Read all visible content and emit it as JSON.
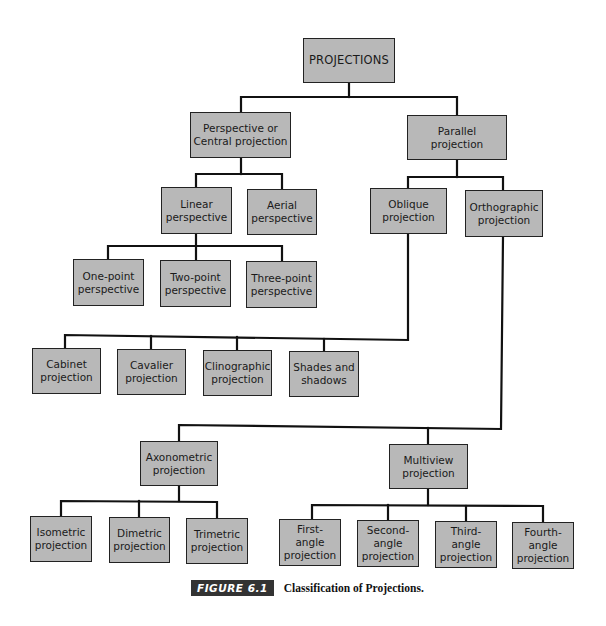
{
  "diagram": {
    "title": "Classification of Projections",
    "colors": {
      "box_fill": "#b8b8b8",
      "box_border": "#222222",
      "line": "#111111",
      "badge_bg": "#333333"
    },
    "nodes": {
      "root": "PROJECTIONS",
      "perspective": "Perspective or\nCentral projection",
      "parallel": "Parallel\nprojection",
      "linear": "Linear\nperspective",
      "aerial": "Aerial\nperspective",
      "one_point": "One-point\nperspective",
      "two_point": "Two-point\nperspective",
      "three_point": "Three-point\nperspective",
      "oblique": "Oblique\nprojection",
      "orthographic": "Orthographic\nprojection",
      "cabinet": "Cabinet\nprojection",
      "cavalier": "Cavalier\nprojection",
      "clinographic": "Clinographic\nprojection",
      "shades": "Shades and\nshadows",
      "axonometric": "Axonometric\nprojection",
      "multiview": "Multiview\nprojection",
      "isometric": "Isometric\nprojection",
      "dimetric": "Dimetric\nprojection",
      "trimetric": "Trimetric\nprojection",
      "first_angle": "First-\nangle\nprojection",
      "second_angle": "Second-\nangle\nprojection",
      "third_angle": "Third-\nangle\nprojection",
      "fourth_angle": "Fourth-\nangle\nprojection"
    },
    "edges": [
      [
        "root",
        "perspective"
      ],
      [
        "root",
        "parallel"
      ],
      [
        "perspective",
        "linear"
      ],
      [
        "perspective",
        "aerial"
      ],
      [
        "linear",
        "one_point"
      ],
      [
        "linear",
        "two_point"
      ],
      [
        "linear",
        "three_point"
      ],
      [
        "parallel",
        "oblique"
      ],
      [
        "parallel",
        "orthographic"
      ],
      [
        "oblique",
        "cabinet"
      ],
      [
        "oblique",
        "cavalier"
      ],
      [
        "oblique",
        "clinographic"
      ],
      [
        "oblique",
        "shades"
      ],
      [
        "orthographic",
        "axonometric"
      ],
      [
        "orthographic",
        "multiview"
      ],
      [
        "axonometric",
        "isometric"
      ],
      [
        "axonometric",
        "dimetric"
      ],
      [
        "axonometric",
        "trimetric"
      ],
      [
        "multiview",
        "first_angle"
      ],
      [
        "multiview",
        "second_angle"
      ],
      [
        "multiview",
        "third_angle"
      ],
      [
        "multiview",
        "fourth_angle"
      ]
    ]
  },
  "caption": {
    "label": "FIGURE 6.1",
    "text": "Classification of Projections."
  }
}
